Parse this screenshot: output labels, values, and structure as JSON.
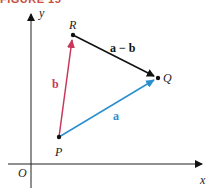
{
  "figure": {
    "title": "FIGURE 15"
  },
  "axes": {
    "x_label": "x",
    "y_label": "y",
    "origin_label": "O"
  },
  "points": {
    "P": {
      "label": "P"
    },
    "Q": {
      "label": "Q"
    },
    "R": {
      "label": "R"
    }
  },
  "vectors": {
    "a": {
      "label": "a",
      "from": "P",
      "to": "Q",
      "color": "#2a8fd0"
    },
    "b": {
      "label": "b",
      "from": "P",
      "to": "R",
      "color": "#c8385a"
    },
    "a_minus_b": {
      "label": "a − b",
      "from": "R",
      "to": "Q",
      "color": "#111111"
    }
  }
}
